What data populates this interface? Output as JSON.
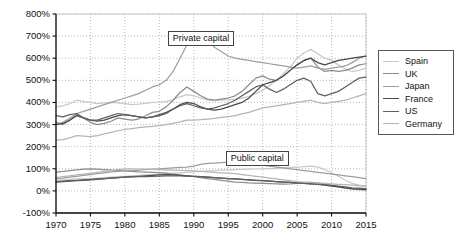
{
  "chart_data": {
    "type": "line",
    "title": "",
    "xlabel": "",
    "ylabel": "",
    "xlim": [
      1970,
      2015
    ],
    "ylim": [
      -100,
      800
    ],
    "grid": true,
    "legend_position": "right",
    "yticks": [
      "-100%",
      "0%",
      "100%",
      "200%",
      "300%",
      "400%",
      "500%",
      "600%",
      "700%",
      "800%"
    ],
    "ytick_values": [
      -100,
      0,
      100,
      200,
      300,
      400,
      500,
      600,
      700,
      800
    ],
    "xticks": [
      "1970",
      "1975",
      "1980",
      "1985",
      "1990",
      "1995",
      "2000",
      "2005",
      "2010",
      "2015"
    ],
    "xtick_values": [
      1970,
      1975,
      1980,
      1985,
      1990,
      1995,
      2000,
      2005,
      2010,
      2015
    ],
    "annotations": [
      {
        "text": "Private capital",
        "x": 1991,
        "y": 690
      },
      {
        "text": "Public capital",
        "x": 1999,
        "y": 150
      }
    ],
    "x": [
      1970,
      1971,
      1972,
      1973,
      1974,
      1975,
      1976,
      1977,
      1978,
      1979,
      1980,
      1981,
      1982,
      1983,
      1984,
      1985,
      1986,
      1987,
      1988,
      1989,
      1990,
      1991,
      1992,
      1993,
      1994,
      1995,
      1996,
      1997,
      1998,
      1999,
      2000,
      2001,
      2002,
      2003,
      2004,
      2005,
      2006,
      2007,
      2008,
      2009,
      2010,
      2011,
      2012,
      2013,
      2014,
      2015
    ],
    "series": [
      {
        "name": "Spain",
        "color": "#c9c9c9",
        "group": "private",
        "values": [
          380,
          385,
          395,
          410,
          405,
          400,
          395,
          398,
          400,
          398,
          395,
          390,
          392,
          396,
          400,
          402,
          405,
          412,
          425,
          435,
          430,
          420,
          412,
          408,
          410,
          412,
          415,
          420,
          428,
          440,
          455,
          475,
          500,
          530,
          560,
          600,
          625,
          640,
          620,
          600,
          590,
          570,
          550,
          540,
          545,
          555
        ]
      },
      {
        "name": "Spain",
        "color": "#c9c9c9",
        "group": "public",
        "values": [
          48,
          50,
          52,
          54,
          55,
          56,
          58,
          60,
          62,
          64,
          66,
          68,
          70,
          72,
          74,
          76,
          78,
          80,
          82,
          84,
          86,
          88,
          90,
          92,
          94,
          95,
          96,
          97,
          98,
          99,
          100,
          101,
          102,
          104,
          106,
          108,
          110,
          112,
          108,
          96,
          82,
          66,
          48,
          34,
          26,
          22
        ]
      },
      {
        "name": "UK",
        "color": "#8d8d8d",
        "group": "private",
        "values": [
          310,
          300,
          320,
          345,
          330,
          310,
          300,
          305,
          315,
          330,
          325,
          320,
          325,
          340,
          355,
          360,
          380,
          410,
          445,
          470,
          450,
          430,
          415,
          410,
          415,
          420,
          430,
          450,
          480,
          510,
          520,
          505,
          500,
          520,
          545,
          570,
          590,
          600,
          560,
          540,
          545,
          540,
          545,
          555,
          570,
          575
        ]
      },
      {
        "name": "UK",
        "color": "#8d8d8d",
        "group": "public",
        "values": [
          85,
          88,
          92,
          95,
          98,
          100,
          98,
          96,
          94,
          92,
          90,
          88,
          86,
          85,
          84,
          83,
          80,
          76,
          72,
          68,
          64,
          60,
          56,
          52,
          48,
          44,
          40,
          38,
          36,
          35,
          34,
          33,
          32,
          31,
          32,
          34,
          36,
          38,
          36,
          30,
          24,
          18,
          12,
          8,
          6,
          5
        ]
      },
      {
        "name": "Japan",
        "color": "#9e9e9e",
        "group": "private",
        "values": [
          300,
          310,
          330,
          350,
          360,
          370,
          380,
          390,
          400,
          410,
          420,
          430,
          440,
          455,
          470,
          480,
          500,
          540,
          600,
          660,
          710,
          700,
          680,
          650,
          630,
          610,
          600,
          595,
          590,
          585,
          580,
          575,
          570,
          565,
          560,
          555,
          560,
          565,
          555,
          550,
          555,
          560,
          565,
          580,
          600,
          610
        ]
      },
      {
        "name": "Japan",
        "color": "#9e9e9e",
        "group": "public",
        "values": [
          55,
          58,
          62,
          66,
          70,
          74,
          78,
          82,
          86,
          88,
          90,
          92,
          94,
          96,
          98,
          100,
          102,
          104,
          106,
          108,
          112,
          120,
          124,
          126,
          128,
          130,
          128,
          126,
          124,
          120,
          116,
          112,
          108,
          104,
          100,
          96,
          92,
          88,
          84,
          80,
          76,
          72,
          68,
          64,
          60,
          56
        ]
      },
      {
        "name": "France",
        "color": "#4a4a4a",
        "group": "private",
        "values": [
          300,
          305,
          320,
          340,
          330,
          320,
          315,
          320,
          330,
          340,
          345,
          340,
          335,
          330,
          335,
          340,
          350,
          370,
          390,
          400,
          395,
          380,
          370,
          365,
          370,
          380,
          390,
          400,
          420,
          450,
          480,
          490,
          500,
          520,
          545,
          570,
          590,
          600,
          580,
          570,
          580,
          590,
          595,
          600,
          605,
          610
        ]
      },
      {
        "name": "France",
        "color": "#4a4a4a",
        "group": "public",
        "values": [
          40,
          42,
          44,
          46,
          48,
          50,
          52,
          55,
          58,
          60,
          62,
          64,
          66,
          68,
          70,
          72,
          74,
          72,
          70,
          68,
          66,
          64,
          62,
          60,
          58,
          56,
          54,
          52,
          50,
          48,
          46,
          44,
          42,
          40,
          38,
          36,
          34,
          32,
          30,
          26,
          22,
          18,
          14,
          10,
          8,
          6
        ]
      },
      {
        "name": "US",
        "color": "#606060",
        "group": "private",
        "values": [
          340,
          335,
          345,
          350,
          330,
          320,
          320,
          330,
          340,
          350,
          345,
          340,
          335,
          330,
          335,
          345,
          355,
          370,
          385,
          395,
          385,
          375,
          370,
          375,
          385,
          395,
          410,
          430,
          450,
          470,
          480,
          460,
          445,
          460,
          480,
          500,
          510,
          495,
          440,
          430,
          440,
          450,
          470,
          490,
          510,
          515
        ]
      },
      {
        "name": "US",
        "color": "#606060",
        "group": "public",
        "values": [
          42,
          44,
          46,
          48,
          50,
          52,
          54,
          56,
          58,
          60,
          62,
          63,
          64,
          65,
          66,
          67,
          68,
          68,
          68,
          67,
          66,
          64,
          62,
          60,
          58,
          56,
          54,
          52,
          50,
          48,
          46,
          44,
          42,
          40,
          38,
          36,
          34,
          32,
          30,
          28,
          26,
          22,
          18,
          14,
          12,
          10
        ]
      },
      {
        "name": "Germany",
        "color": "#b5b5b5",
        "group": "private",
        "values": [
          230,
          232,
          240,
          250,
          248,
          245,
          250,
          258,
          265,
          272,
          278,
          282,
          286,
          290,
          292,
          295,
          300,
          305,
          312,
          320,
          320,
          322,
          325,
          328,
          332,
          336,
          340,
          348,
          355,
          365,
          375,
          380,
          385,
          390,
          395,
          400,
          405,
          410,
          400,
          395,
          400,
          405,
          410,
          420,
          430,
          440
        ]
      },
      {
        "name": "Germany",
        "color": "#b5b5b5",
        "group": "public",
        "values": [
          60,
          64,
          68,
          72,
          76,
          80,
          84,
          88,
          92,
          96,
          100,
          100,
          99,
          98,
          97,
          96,
          95,
          94,
          93,
          92,
          90,
          88,
          86,
          84,
          82,
          80,
          78,
          74,
          70,
          66,
          62,
          58,
          54,
          50,
          46,
          42,
          40,
          38,
          36,
          34,
          32,
          30,
          28,
          26,
          24,
          22
        ]
      }
    ],
    "legend": [
      {
        "label": "Spain",
        "color": "#c9c9c9"
      },
      {
        "label": "UK",
        "color": "#8d8d8d"
      },
      {
        "label": "Japan",
        "color": "#9e9e9e"
      },
      {
        "label": "France",
        "color": "#4a4a4a"
      },
      {
        "label": "US",
        "color": "#606060"
      },
      {
        "label": "Germany",
        "color": "#b5b5b5"
      }
    ]
  }
}
